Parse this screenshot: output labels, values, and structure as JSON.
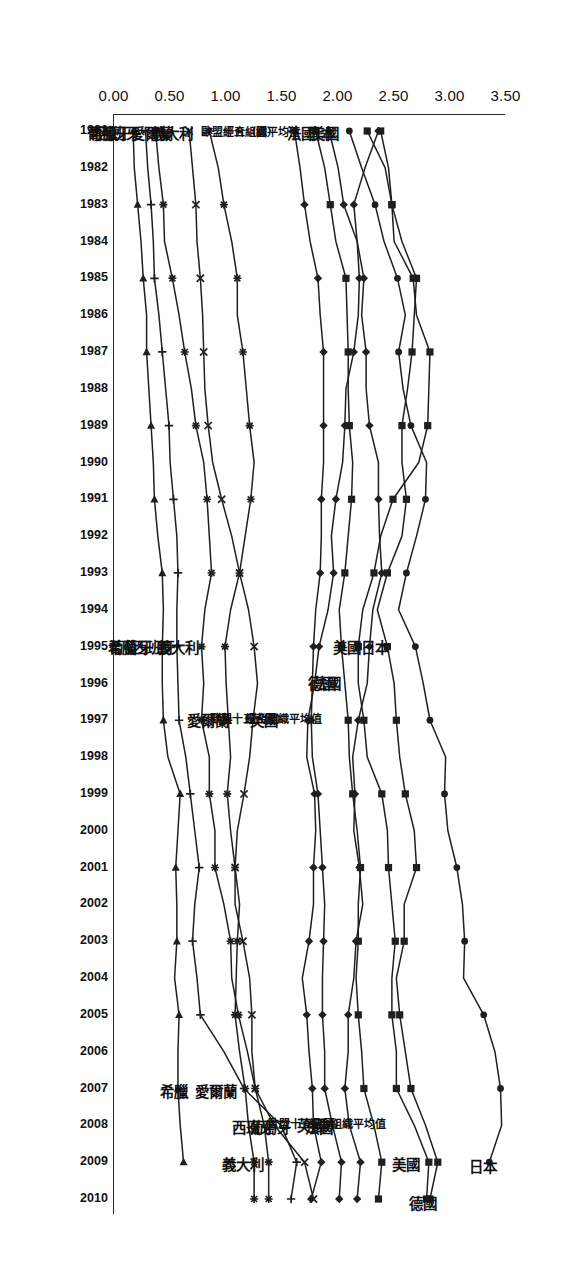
{
  "chart_data": {
    "type": "line",
    "title": "",
    "subtitle": "",
    "xlabel": "",
    "ylabel": "",
    "orientation": "rotated-90",
    "grid": false,
    "legend": "inline-series-labels",
    "ylim": [
      0.0,
      3.5
    ],
    "yticks": [
      "0.00",
      "0.50",
      "1.00",
      "1.50",
      "2.00",
      "2.50",
      "3.00",
      "3.50"
    ],
    "ytick_values": [
      0.0,
      0.5,
      1.0,
      1.5,
      2.0,
      2.5,
      3.0,
      3.5
    ],
    "x": [
      1981,
      1982,
      1983,
      1984,
      1985,
      1986,
      1987,
      1988,
      1989,
      1990,
      1991,
      1992,
      1993,
      1994,
      1995,
      1996,
      1997,
      1998,
      1999,
      2000,
      2001,
      2002,
      2003,
      2004,
      2005,
      2006,
      2007,
      2008,
      2009,
      2010
    ],
    "xticks": [
      "1981",
      "1982",
      "1983",
      "1984",
      "1985",
      "1986",
      "1987",
      "1988",
      "1989",
      "1990",
      "1991",
      "1992",
      "1993",
      "1994",
      "1995",
      "1996",
      "1997",
      "1998",
      "1999",
      "2000",
      "2001",
      "2002",
      "2003",
      "2004",
      "2005",
      "2006",
      "2007",
      "2008",
      "2009",
      "2010"
    ],
    "series": [
      {
        "name": "日本",
        "marker": "circle",
        "values": [
          2.11,
          2.22,
          2.34,
          2.42,
          2.54,
          2.61,
          2.55,
          2.59,
          2.66,
          2.8,
          2.79,
          2.71,
          2.62,
          2.55,
          2.7,
          2.77,
          2.83,
          2.97,
          2.96,
          2.99,
          3.07,
          3.12,
          3.14,
          3.13,
          3.31,
          3.41,
          3.46,
          3.47,
          3.36,
          null
        ]
      },
      {
        "name": "美國",
        "marker": "square",
        "values": [
          2.27,
          2.43,
          2.49,
          2.58,
          2.71,
          2.69,
          2.67,
          2.63,
          2.58,
          2.58,
          2.62,
          2.58,
          2.45,
          2.36,
          2.45,
          2.51,
          2.53,
          2.56,
          2.61,
          2.69,
          2.71,
          2.6,
          2.6,
          2.53,
          2.56,
          2.61,
          2.66,
          2.79,
          2.9,
          2.83
        ]
      },
      {
        "name": "德國",
        "marker": "square",
        "values": [
          2.39,
          2.46,
          2.49,
          2.51,
          2.68,
          2.71,
          2.83,
          2.82,
          2.81,
          2.73,
          2.5,
          2.39,
          2.33,
          2.23,
          2.19,
          2.19,
          2.24,
          2.27,
          2.4,
          2.45,
          2.46,
          2.49,
          2.52,
          2.49,
          2.49,
          2.53,
          2.53,
          2.69,
          2.82,
          2.8
        ]
      },
      {
        "name": "法國",
        "marker": "diamond",
        "values": [
          1.93,
          2.01,
          2.06,
          2.18,
          2.24,
          2.22,
          2.26,
          2.26,
          2.29,
          2.37,
          2.37,
          2.38,
          2.4,
          2.32,
          2.29,
          2.27,
          2.19,
          2.14,
          2.16,
          2.15,
          2.2,
          2.23,
          2.17,
          2.15,
          2.1,
          2.1,
          2.07,
          2.11,
          2.21,
          2.18
        ]
      },
      {
        "name": "經合組織平均值",
        "marker": "square",
        "values": [
          1.81,
          1.89,
          1.94,
          1.99,
          2.08,
          2.09,
          2.1,
          2.1,
          2.11,
          2.14,
          2.13,
          2.1,
          2.07,
          2.02,
          2.04,
          2.07,
          2.1,
          2.11,
          2.14,
          2.18,
          2.21,
          2.19,
          2.19,
          2.17,
          2.19,
          2.22,
          2.24,
          2.33,
          2.4,
          2.37
        ]
      },
      {
        "name": "歐盟十五（國）",
        "marker": "diamond",
        "values": [
          1.62,
          1.67,
          1.71,
          1.76,
          1.83,
          1.85,
          1.88,
          1.88,
          1.88,
          1.88,
          1.86,
          1.86,
          1.85,
          1.81,
          1.79,
          1.78,
          1.77,
          1.78,
          1.83,
          1.85,
          1.87,
          1.89,
          1.88,
          1.87,
          1.87,
          1.89,
          1.89,
          1.96,
          2.04,
          2.02
        ]
      },
      {
        "name": "英國",
        "marker": "diamond",
        "values": [
          2.37,
          2.25,
          2.15,
          2.18,
          2.2,
          2.19,
          2.15,
          2.08,
          2.07,
          2.05,
          1.99,
          1.95,
          1.97,
          1.92,
          1.84,
          1.8,
          1.74,
          1.73,
          1.8,
          1.81,
          1.79,
          1.79,
          1.75,
          1.69,
          1.73,
          1.75,
          1.78,
          1.79,
          1.86,
          1.77
        ]
      },
      {
        "name": "義大利",
        "marker": "asterisk",
        "values": [
          0.86,
          0.94,
          0.99,
          1.06,
          1.11,
          1.11,
          1.16,
          1.19,
          1.22,
          1.26,
          1.23,
          1.18,
          1.13,
          1.05,
          1.0,
          1.01,
          1.03,
          1.05,
          1.02,
          1.05,
          1.09,
          1.13,
          1.11,
          1.1,
          1.09,
          1.13,
          1.18,
          1.21,
          1.26,
          1.26
        ]
      },
      {
        "name": "愛爾蘭",
        "marker": "cross",
        "values": [
          0.68,
          0.71,
          0.74,
          0.75,
          0.78,
          0.8,
          0.81,
          0.82,
          0.85,
          0.89,
          0.97,
          1.06,
          1.13,
          1.21,
          1.26,
          1.29,
          1.25,
          1.22,
          1.17,
          1.11,
          1.09,
          1.09,
          1.16,
          1.22,
          1.24,
          1.24,
          1.27,
          1.44,
          1.71,
          1.79
        ]
      },
      {
        "name": "西班牙",
        "marker": "asterisk",
        "values": [
          0.38,
          0.41,
          0.45,
          0.46,
          0.53,
          0.59,
          0.64,
          0.7,
          0.74,
          0.81,
          0.84,
          0.86,
          0.88,
          0.82,
          0.79,
          0.81,
          0.79,
          0.86,
          0.86,
          0.91,
          0.91,
          0.99,
          1.05,
          1.06,
          1.12,
          1.2,
          1.27,
          1.35,
          1.39,
          1.39
        ]
      },
      {
        "name": "葡萄牙",
        "marker": "plus",
        "values": [
          0.29,
          0.31,
          0.34,
          0.36,
          0.37,
          0.41,
          0.44,
          0.47,
          0.5,
          0.51,
          0.54,
          0.57,
          0.58,
          0.57,
          0.57,
          0.58,
          0.59,
          0.65,
          0.69,
          0.73,
          0.77,
          0.73,
          0.71,
          0.75,
          0.78,
          0.99,
          1.17,
          1.5,
          1.64,
          1.59
        ]
      },
      {
        "name": "希臘",
        "marker": "triangle",
        "values": [
          0.18,
          0.19,
          0.22,
          0.25,
          0.27,
          0.3,
          0.3,
          0.32,
          0.34,
          0.36,
          0.37,
          0.4,
          0.44,
          0.45,
          0.44,
          0.44,
          0.45,
          0.49,
          0.6,
          0.58,
          0.56,
          0.57,
          0.57,
          0.55,
          0.59,
          0.58,
          0.58,
          0.6,
          0.63,
          null
        ]
      }
    ],
    "annotations": {
      "top": [
        {
          "label": "日本",
          "series": "日本"
        },
        {
          "label": "美國",
          "series": "美國"
        },
        {
          "label": "德國",
          "series": "德國"
        },
        {
          "label": "經合組織平均值",
          "series": "經合組織平均值"
        },
        {
          "label": "法國",
          "series": "法國"
        },
        {
          "label": "歐盟十五（國）",
          "series": "歐盟十五（國）"
        },
        {
          "label": "英國",
          "series": "英國"
        },
        {
          "label": "愛爾蘭",
          "series": "愛爾蘭"
        },
        {
          "label": "葡萄牙",
          "series": "葡萄牙"
        },
        {
          "label": "西班牙",
          "series": "西班牙"
        },
        {
          "label": "義大利",
          "series": "義大利"
        },
        {
          "label": "希臘",
          "series": "希臘"
        }
      ],
      "middle": [
        {
          "label": "日本",
          "series": "日本"
        },
        {
          "label": "美國",
          "series": "美國"
        },
        {
          "label": "法國",
          "series": "法國"
        },
        {
          "label": "德國",
          "series": "德國"
        },
        {
          "label": "英國",
          "series": "英國"
        },
        {
          "label": "歐盟十五（國）",
          "series": "歐盟十五（國）"
        },
        {
          "label": "經合組織平均值",
          "series": "經合組織平均值"
        },
        {
          "label": "愛爾蘭",
          "series": "愛爾蘭"
        },
        {
          "label": "義大利",
          "series": "義大利"
        },
        {
          "label": "西班牙",
          "series": "西班牙"
        },
        {
          "label": "葡萄牙",
          "series": "葡萄牙"
        },
        {
          "label": "希臘",
          "series": "希臘"
        }
      ],
      "bottom": [
        {
          "label": "美國",
          "series": "美國"
        },
        {
          "label": "日本",
          "series": "日本"
        },
        {
          "label": "法國",
          "series": "法國"
        },
        {
          "label": "歐盟十五（國）",
          "series": "歐盟十五（國）"
        },
        {
          "label": "經合組織平均值",
          "series": "經合組織平均值"
        },
        {
          "label": "義大利",
          "series": "義大利"
        },
        {
          "label": "愛爾蘭",
          "series": "愛爾蘭"
        },
        {
          "label": "西班牙",
          "series": "西班牙"
        },
        {
          "label": "葡萄牙",
          "series": "葡萄牙"
        },
        {
          "label": "希臘",
          "series": "希臘"
        }
      ]
    },
    "colors": {
      "line": "#1f1f1f",
      "axis": "#2a2a2a",
      "background": "#ffffff"
    }
  }
}
